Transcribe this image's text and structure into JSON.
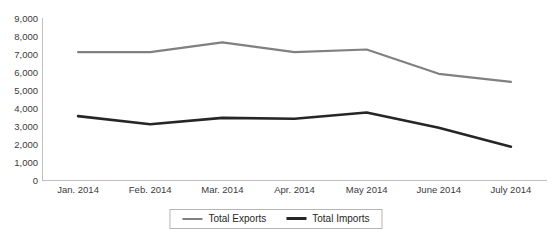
{
  "chart_data": {
    "type": "line",
    "title": "",
    "xlabel": "",
    "ylabel": "",
    "categories": [
      "Jan. 2014",
      "Feb. 2014",
      "Mar. 2014",
      "Apr. 2014",
      "May 2014",
      "June 2014",
      "July 2014"
    ],
    "series": [
      {
        "name": "Total Exports",
        "color": "#808080",
        "values": [
          7100,
          7100,
          7650,
          7100,
          7250,
          5900,
          5450
        ]
      },
      {
        "name": "Total Imports",
        "color": "#262626",
        "values": [
          3550,
          3100,
          3450,
          3400,
          3750,
          2900,
          1850
        ]
      }
    ],
    "ylim": [
      0,
      9000
    ],
    "ytick_labels": [
      "0",
      "1,000",
      "2,000",
      "3,000",
      "4,000",
      "5,000",
      "6,000",
      "7,000",
      "8,000",
      "9,000"
    ],
    "ytick_values": [
      0,
      1000,
      2000,
      3000,
      4000,
      5000,
      6000,
      7000,
      8000,
      9000
    ],
    "grid": false,
    "legend_position": "bottom"
  },
  "legend": {
    "entries": [
      {
        "label": "Total Exports"
      },
      {
        "label": "Total Imports"
      }
    ]
  },
  "title_remnant": ""
}
